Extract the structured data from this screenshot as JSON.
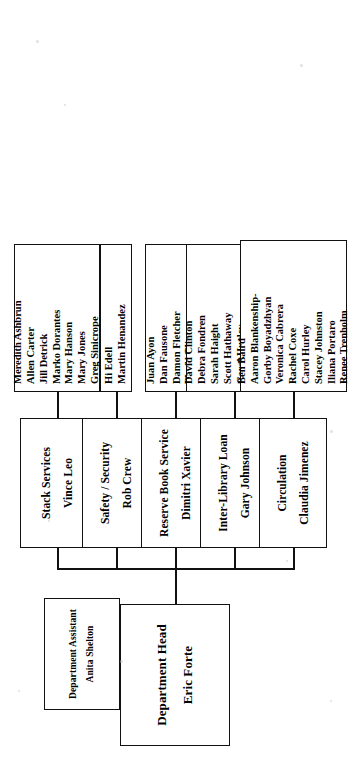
{
  "chart": {
    "kind": "organizational-chart",
    "orientation": "rotated-90-counterclockwise",
    "root": {
      "title": "Department Head",
      "person": "Eric Forte"
    },
    "assistant": {
      "title": "Department Assistant",
      "person": "Anita Shelton"
    },
    "units": [
      {
        "title": "Circulation",
        "person": "Claudia Jimenez",
        "staff": [
          "Ben Baird",
          "Aaron Blankenship-",
          "Gorby Boyadzhyan",
          "Veronica Cabrera",
          "Rachel Coxe",
          "Carol Hurley",
          "Stacey Johnston",
          "Iliana Portaro",
          "Renee Trenholm"
        ]
      },
      {
        "title": "Inter-Library Loan",
        "person": "Gary Johnson",
        "staff": [
          "David Clinton",
          "Debra Fondren",
          "Sarah Haight",
          "Scott Hathaway",
          "Carol Hurley",
          "Christian Layow",
          "Jill Tenney",
          "Dana Welch"
        ]
      },
      {
        "title": "Reserve Book Service",
        "person": "Dimitri Xavier",
        "staff": [
          "Juan Ayon",
          "Dan Fausone",
          "Damon Fletcher",
          "Mark Okuno",
          "John Poehler"
        ]
      },
      {
        "title": "Safety / Security",
        "person": "Rob Crew",
        "staff": [
          "Hi Edell",
          "Martin Henandez"
        ]
      },
      {
        "title": "Stack Services",
        "person": "Vince Leo",
        "staff": [
          "Meredith Ashbrun",
          "Allen Carter",
          "Jill Detrick",
          "Marko Dorantes",
          "Mary Hanson",
          "Mary Jones",
          "Greg Sinicrope"
        ]
      }
    ]
  }
}
